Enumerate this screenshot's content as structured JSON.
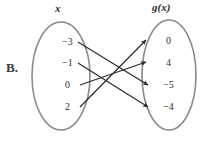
{
  "choice": {
    "label": "B."
  },
  "diagram": {
    "domain_header": "x",
    "range_header": "g(x)",
    "ellipse_color": "#8a8a8a",
    "arrow_color": "#2b2b2b",
    "text_color": "#2f2f2f",
    "domain_values": [
      {
        "label": "−3",
        "x": 62,
        "y": 36
      },
      {
        "label": "−1",
        "x": 62,
        "y": 57
      },
      {
        "label": "0",
        "x": 65,
        "y": 79
      },
      {
        "label": "2",
        "x": 65,
        "y": 101
      }
    ],
    "range_values": [
      {
        "label": "0",
        "x": 166,
        "y": 35
      },
      {
        "label": "4",
        "x": 166,
        "y": 57
      },
      {
        "label": "−5",
        "x": 163,
        "y": 79
      },
      {
        "label": "−4",
        "x": 163,
        "y": 101
      }
    ],
    "arrows": [
      {
        "name": "arrow-neg3-to-neg5",
        "from": "−3",
        "to": "−5",
        "x1": 78,
        "y1": 42,
        "x2": 148,
        "y2": 85
      },
      {
        "name": "arrow-neg1-to-neg4",
        "from": "−1",
        "to": "−4",
        "x1": 78,
        "y1": 63,
        "x2": 148,
        "y2": 107
      },
      {
        "name": "arrow-0-to-4",
        "from": "0",
        "to": "4",
        "x1": 80,
        "y1": 85,
        "x2": 146,
        "y2": 62
      },
      {
        "name": "arrow-2-to-0",
        "from": "2",
        "to": "0",
        "x1": 80,
        "y1": 107,
        "x2": 146,
        "y2": 40
      }
    ],
    "domain_ellipse": {
      "cx": 61,
      "cy": 76,
      "rx": 29,
      "ry": 54
    },
    "range_ellipse": {
      "cx": 169,
      "cy": 75,
      "rx": 27,
      "ry": 55
    }
  }
}
